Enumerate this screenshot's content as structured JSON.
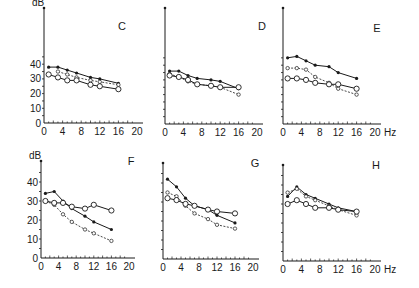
{
  "figure": {
    "y_unit_label": "dB",
    "x_unit_label": "Hz",
    "x_ticks": [
      0,
      4,
      8,
      12,
      16,
      20
    ],
    "y_ticks": [
      0,
      10,
      20,
      30,
      40
    ],
    "ink_color": "#1a1a1a"
  },
  "chart_data": [
    {
      "type": "line",
      "panel": "C",
      "title": "C",
      "xlabel": "",
      "ylabel": "dB",
      "xlim": [
        0,
        20
      ],
      "ylim": [
        0,
        50
      ],
      "x_ticks": [
        0,
        4,
        8,
        12,
        16,
        20
      ],
      "y_ticks": [
        0,
        10,
        20,
        30,
        40
      ],
      "show_y_tick_labels": true,
      "show_x_unit": false,
      "grid": false,
      "series": [
        {
          "name": "filled-dot-solid",
          "style": "solid",
          "marker": "filled",
          "x": [
            1,
            3,
            5,
            7,
            10,
            12,
            16
          ],
          "values": [
            38,
            38,
            36,
            34,
            31,
            30,
            27
          ]
        },
        {
          "name": "small-open-dashed",
          "style": "dashed",
          "marker": "small-open",
          "x": [
            3,
            5,
            7,
            10,
            12,
            16
          ],
          "values": [
            35,
            33,
            31,
            29,
            28,
            26
          ]
        },
        {
          "name": "open-circle-solid",
          "style": "solid",
          "marker": "open",
          "x": [
            1,
            3,
            5,
            7,
            10,
            12,
            16
          ],
          "values": [
            33,
            31,
            29,
            29,
            26,
            25,
            23
          ]
        }
      ]
    },
    {
      "type": "line",
      "panel": "D",
      "title": "D",
      "xlim": [
        0,
        20
      ],
      "ylim": [
        0,
        50
      ],
      "x_ticks": [
        0,
        4,
        8,
        12,
        16,
        20
      ],
      "y_ticks": [
        0,
        10,
        20,
        30,
        40
      ],
      "show_y_tick_labels": false,
      "show_x_unit": false,
      "grid": false,
      "series": [
        {
          "name": "filled-dot-solid",
          "style": "solid",
          "marker": "filled",
          "x": [
            1,
            3,
            5,
            7,
            10,
            12,
            16
          ],
          "values": [
            36,
            36,
            33,
            31,
            30,
            29,
            24
          ]
        },
        {
          "name": "small-open-dashed",
          "style": "dashed",
          "marker": "small-open",
          "x": [
            1,
            3,
            5,
            7,
            10,
            12,
            16
          ],
          "values": [
            34,
            32,
            29,
            27,
            26,
            25,
            20
          ]
        },
        {
          "name": "open-circle-solid",
          "style": "solid",
          "marker": "open",
          "x": [
            1,
            3,
            5,
            7,
            10,
            12,
            16
          ],
          "values": [
            33,
            32,
            30,
            27,
            26,
            25,
            25
          ]
        }
      ]
    },
    {
      "type": "line",
      "panel": "E",
      "title": "E",
      "xlim": [
        0,
        20
      ],
      "ylim": [
        0,
        50
      ],
      "x_ticks": [
        0,
        4,
        8,
        12,
        16,
        20
      ],
      "y_ticks": [
        0,
        10,
        20,
        30,
        40
      ],
      "show_y_tick_labels": false,
      "show_x_unit": true,
      "grid": false,
      "series": [
        {
          "name": "filled-dot-solid",
          "style": "solid",
          "marker": "filled",
          "x": [
            1,
            3,
            5,
            7,
            10,
            12,
            16
          ],
          "values": [
            45,
            46,
            43,
            40,
            39,
            35,
            31
          ]
        },
        {
          "name": "small-open-dashed",
          "style": "dashed",
          "marker": "small-open",
          "x": [
            1,
            3,
            5,
            7,
            10,
            12,
            16
          ],
          "values": [
            38,
            38,
            37,
            32,
            28,
            24,
            20
          ]
        },
        {
          "name": "open-circle-solid",
          "style": "solid",
          "marker": "open",
          "x": [
            1,
            3,
            5,
            7,
            10,
            12,
            16
          ],
          "values": [
            31,
            31,
            30,
            28,
            27,
            27,
            24
          ]
        }
      ]
    },
    {
      "type": "line",
      "panel": "F",
      "title": "F",
      "xlim": [
        0,
        20
      ],
      "ylim": [
        0,
        50
      ],
      "x_ticks": [
        0,
        4,
        8,
        12,
        16,
        20
      ],
      "y_ticks": [
        0,
        10,
        20,
        30,
        40
      ],
      "show_y_tick_labels": true,
      "show_x_unit": false,
      "grid": false,
      "series": [
        {
          "name": "filled-dot-solid",
          "style": "solid",
          "marker": "filled",
          "x": [
            1,
            3,
            5,
            7,
            10,
            12,
            16
          ],
          "values": [
            34,
            35,
            30,
            26,
            22,
            19,
            15
          ]
        },
        {
          "name": "small-open-dashed",
          "style": "dashed",
          "marker": "small-open",
          "x": [
            1,
            3,
            5,
            7,
            10,
            12,
            16
          ],
          "values": [
            30,
            28,
            23,
            19,
            15,
            13,
            9
          ]
        },
        {
          "name": "open-circle-solid",
          "style": "solid",
          "marker": "open",
          "x": [
            1,
            3,
            5,
            7,
            10,
            12,
            16
          ],
          "values": [
            30,
            29,
            29,
            27,
            26,
            28,
            25
          ]
        }
      ]
    },
    {
      "type": "line",
      "panel": "G",
      "title": "G",
      "xlim": [
        0,
        20
      ],
      "ylim": [
        0,
        50
      ],
      "x_ticks": [
        0,
        4,
        8,
        12,
        16,
        20
      ],
      "y_ticks": [
        0,
        10,
        20,
        30,
        40
      ],
      "show_y_tick_labels": false,
      "show_x_unit": false,
      "grid": false,
      "series": [
        {
          "name": "filled-dot-solid",
          "style": "solid",
          "marker": "filled",
          "x": [
            1,
            3,
            5,
            7,
            10,
            12,
            16
          ],
          "values": [
            42,
            38,
            32,
            28,
            26,
            23,
            19
          ]
        },
        {
          "name": "small-open-dashed",
          "style": "dashed",
          "marker": "small-open",
          "x": [
            1,
            3,
            5,
            7,
            10,
            12,
            16
          ],
          "values": [
            35,
            33,
            28,
            24,
            21,
            18,
            16
          ]
        },
        {
          "name": "open-circle-solid",
          "style": "solid",
          "marker": "open",
          "x": [
            1,
            3,
            5,
            7,
            10,
            12,
            16
          ],
          "values": [
            32,
            31,
            29,
            28,
            26,
            25,
            24
          ]
        }
      ]
    },
    {
      "type": "line",
      "panel": "H",
      "title": "H",
      "xlim": [
        0,
        20
      ],
      "ylim": [
        0,
        50
      ],
      "x_ticks": [
        0,
        4,
        8,
        12,
        16,
        20
      ],
      "y_ticks": [
        0,
        10,
        20,
        30,
        40
      ],
      "show_y_tick_labels": false,
      "show_x_unit": true,
      "grid": false,
      "series": [
        {
          "name": "filled-dot-solid",
          "style": "solid",
          "marker": "filled",
          "x": [
            1,
            3,
            5,
            7,
            10,
            12,
            16
          ],
          "values": [
            34,
            39,
            35,
            33,
            30,
            28,
            26
          ]
        },
        {
          "name": "small-open-dashed",
          "style": "dashed",
          "marker": "small-open",
          "x": [
            1,
            3,
            5,
            7,
            10,
            12,
            16
          ],
          "values": [
            36,
            38,
            34,
            32,
            29,
            27,
            24
          ]
        },
        {
          "name": "open-circle-solid",
          "style": "solid",
          "marker": "open",
          "x": [
            1,
            3,
            5,
            7,
            10,
            12,
            16
          ],
          "values": [
            30,
            32,
            30,
            28,
            28,
            27,
            26
          ]
        }
      ]
    }
  ],
  "layout": {
    "panels": [
      {
        "id": "C",
        "x0": 44,
        "y0": 123,
        "px_per_hz": 4.65,
        "px_per_db": 1.47,
        "yaxis_top": 8,
        "title_x": 122,
        "title_y": 30
      },
      {
        "id": "D",
        "x0": 165,
        "y0": 124,
        "px_per_hz": 4.6,
        "px_per_db": 1.47,
        "yaxis_top": 8,
        "title_x": 262,
        "title_y": 30
      },
      {
        "id": "E",
        "x0": 283,
        "y0": 124,
        "px_per_hz": 4.6,
        "px_per_db": 1.47,
        "yaxis_top": 8,
        "title_x": 377,
        "title_y": 32
      },
      {
        "id": "F",
        "x0": 41,
        "y0": 258,
        "px_per_hz": 4.4,
        "px_per_db": 1.9,
        "yaxis_top": 161,
        "title_x": 131,
        "title_y": 165
      },
      {
        "id": "G",
        "x0": 163,
        "y0": 259,
        "px_per_hz": 4.5,
        "px_per_db": 1.9,
        "yaxis_top": 163,
        "title_x": 255,
        "title_y": 167
      },
      {
        "id": "H",
        "x0": 283,
        "y0": 261,
        "px_per_hz": 4.6,
        "px_per_db": 1.9,
        "yaxis_top": 165,
        "title_x": 376,
        "title_y": 169
      }
    ]
  }
}
